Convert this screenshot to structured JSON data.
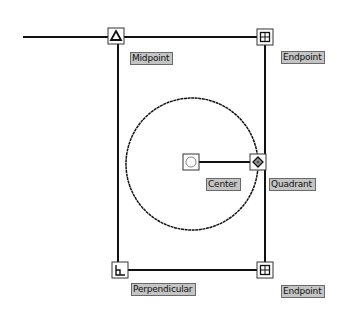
{
  "diagram": {
    "shapes": {
      "top_line": {
        "x1": 23,
        "y1": 37,
        "x2": 265,
        "y2": 37
      },
      "left_line": {
        "x1": 118,
        "y1": 37,
        "x2": 118,
        "y2": 270
      },
      "right_line": {
        "x1": 265,
        "y1": 37,
        "x2": 265,
        "y2": 270
      },
      "bottom_line": {
        "x1": 118,
        "y1": 270,
        "x2": 265,
        "y2": 270
      },
      "circle": {
        "cx": 192,
        "cy": 164,
        "r": 66
      },
      "radius_line": {
        "x1": 191,
        "y1": 162,
        "x2": 258,
        "y2": 162
      }
    },
    "markers": [
      {
        "id": "midpoint",
        "icon": "triangle-icon",
        "cx": 116,
        "cy": 36
      },
      {
        "id": "endpoint-top",
        "icon": "endpoint-square-icon",
        "cx": 265,
        "cy": 37
      },
      {
        "id": "center",
        "icon": "circle-icon",
        "cx": 191,
        "cy": 162
      },
      {
        "id": "quadrant",
        "icon": "diamond-icon",
        "cx": 258,
        "cy": 162
      },
      {
        "id": "perpendicular",
        "icon": "perpendicular-icon",
        "cx": 120,
        "cy": 270
      },
      {
        "id": "endpoint-bottom",
        "icon": "endpoint-square-icon",
        "cx": 265,
        "cy": 270
      }
    ],
    "labels": {
      "midpoint": "Midpoint",
      "endpoint_top": "Endpoint",
      "center": "Center",
      "quadrant": "Quadrant",
      "perpendicular": "Perpendicular",
      "endpoint_bottom": "Endpoint"
    },
    "colors": {
      "line": "#111111",
      "label_bg": "#c4c4c4",
      "marker_border": "#333333"
    }
  }
}
